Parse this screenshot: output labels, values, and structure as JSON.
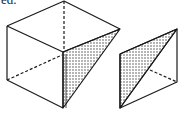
{
  "caption_fragment": "ed.",
  "figures": [
    {
      "name": "cube-with-cut",
      "description": "Cube with a shaded triangular cross-section on the right face",
      "stroke": "#1a1a1a",
      "shade_pattern": "stipple"
    },
    {
      "name": "cut-piece",
      "description": "Removed wedge piece with shaded triangular face and dashed hidden edge",
      "stroke": "#1a1a1a",
      "shade_pattern": "stipple"
    }
  ]
}
